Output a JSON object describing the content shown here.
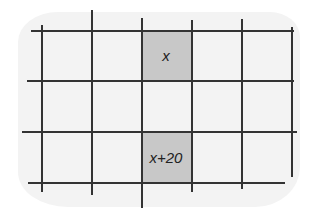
{
  "diagram": {
    "shaded_cells": [
      {
        "row": 0,
        "col": 2,
        "label": "x"
      },
      {
        "row": 2,
        "col": 2,
        "label": "x+20"
      }
    ],
    "colors": {
      "background_blob": "#f3f3f3",
      "shaded_cell": "#c8c8c8",
      "grid_line": "#333333"
    }
  }
}
